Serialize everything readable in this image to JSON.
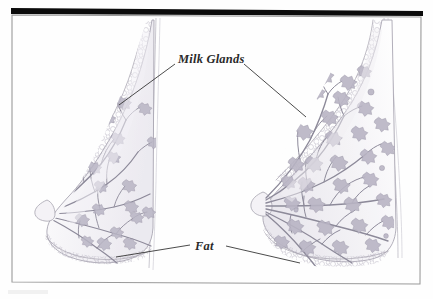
{
  "figure": {
    "caption": "",
    "background_color": "#fefefe",
    "frame": {
      "border_color": "#9a9a9a",
      "border_width": 1,
      "top_bar_color": "#0b0b0b",
      "top_bar_label": "top-black-bar"
    },
    "labels": [
      {
        "id": "milk-glands",
        "text": "Milk Glands",
        "x": 178,
        "y": 62,
        "font_style": "italic",
        "color": "#2a2a2a",
        "leader_lines": [
          {
            "from": [
              175,
              64
            ],
            "to": [
              118,
              105
            ]
          },
          {
            "from": [
              243,
              64
            ],
            "to": [
              305,
              117
            ]
          }
        ]
      },
      {
        "id": "fat",
        "text": "Fat",
        "x": 196,
        "y": 247,
        "font_style": "italic",
        "color": "#2a2a2a",
        "leader_lines": [
          {
            "from": [
              191,
              245
            ],
            "to": [
              116,
              257
            ]
          },
          {
            "from": [
              226,
              246
            ],
            "to": [
              300,
              263
            ]
          }
        ]
      }
    ],
    "illustrations": [
      {
        "id": "left-breast",
        "name": "non-lactating-breast-cross-section",
        "description": "Sagittal cross-section of a resting (non-lactating) breast with sparse branching milk ducts, small glandular lobules and a subcutaneous fat layer.",
        "tissue_color": "#b8b4c4",
        "duct_color": "#8d8a9a",
        "fat_color": "#b9b6c2"
      },
      {
        "id": "right-breast",
        "name": "lactating-breast-cross-section",
        "description": "Sagittal cross-section of a lactating breast showing enlarged, numerous milk glands filling the tissue and a thicker subcutaneous fat layer.",
        "tissue_color": "#b8b4c4",
        "duct_color": "#8d8a9a",
        "fat_color": "#b9b6c2"
      }
    ]
  }
}
